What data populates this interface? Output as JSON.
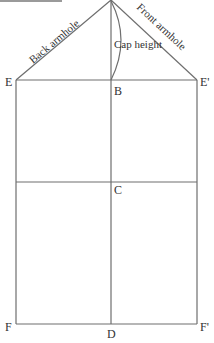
{
  "diagram": {
    "type": "sleeve pattern draft",
    "top_text_cropped": "...",
    "points": {
      "E": "E",
      "E_prime": "E'",
      "B": "B",
      "C": "C",
      "D": "D",
      "F": "F",
      "F_prime": "F'"
    },
    "line_labels": {
      "back_armhole": "Back armhole",
      "front_armhole": "Front armhole",
      "cap_height": "Cap height"
    },
    "colors": {
      "line": "#6e6e6e",
      "text": "#333333",
      "background": "#ffffff"
    }
  }
}
